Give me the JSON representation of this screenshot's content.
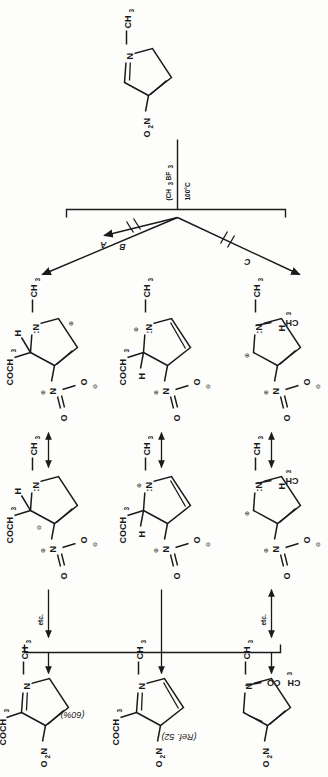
{
  "figure": {
    "kind": "reaction-scheme",
    "orientation": "rotated-90-ccw",
    "reference": "(Ref. 52)",
    "yield": "(60%)",
    "etc_label": "etc.",
    "substituents": {
      "acetyl_left": "COCH",
      "acetyl_right": "CH",
      "acetyl_right_tail": "CO",
      "nitro_left": "O",
      "nitro_left_tail": "N",
      "nitro_atom": "N",
      "oxygen": "O",
      "nitrogen": "N",
      "nitrogen_lone": ":N",
      "methyl": "CH",
      "hydrogen": "H",
      "sub3": "3",
      "sub2": "2",
      "plus": "⊕",
      "minus": "⊖"
    }
  },
  "starting_material": {
    "name": "1-methyl-3-nitropyrrole",
    "ring_nitrogen": "N",
    "n_methyl": "CH",
    "n_methyl_sub": "3",
    "nitro": "O",
    "nitro_sub": "2",
    "nitro_n": "N"
  },
  "conditions": {
    "reagent": "BF",
    "reagent_sub": "3",
    "anhydride": "(CH",
    "anhydride_sub1": "3",
    "anhydride_mid": "CO)",
    "anhydride_sub2": "2",
    "anhydride_end": "O",
    "temperature": "100°C"
  },
  "pathways": [
    {
      "id": "A",
      "label": "A",
      "barrier": false
    },
    {
      "id": "B",
      "label": "B",
      "barrier": true
    },
    {
      "id": "C",
      "label": "C",
      "barrier": true
    }
  ],
  "rows": [
    {
      "pathway": "A",
      "product_name": "2-acetyl-1-methyl-4-nitropyrrole",
      "annotation": "(60%)",
      "terminal_arrow": "single",
      "etc": "etc."
    },
    {
      "pathway": "B",
      "product_name": "3-acetyl-1-methyl-4-nitropyrrole",
      "annotation": "(Ref. 52)",
      "terminal_arrow": "plain-line",
      "etc": ""
    },
    {
      "pathway": "C",
      "product_name": "2-acetyl-1-methyl-3-nitropyrrole",
      "annotation": "",
      "terminal_arrow": "double",
      "etc": "etc."
    }
  ],
  "resonance_arrow": "↔"
}
